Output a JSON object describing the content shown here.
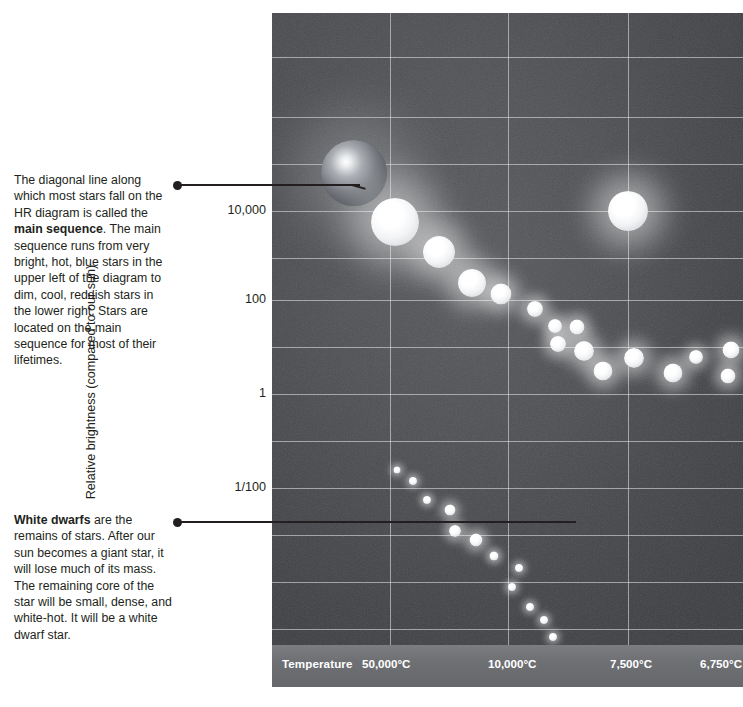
{
  "annotations": {
    "main_sequence": {
      "name": "main-sequence-note",
      "text_before": "The diagonal line along which most stars fall on the HR diagram is called the ",
      "bold": "main sequence",
      "text_after": ". The main sequence runs from very bright, hot, blue stars in the upper left of the diagram to dim, cool, reddish stars in the lower right. Stars are located on the main sequence for most of their lifetimes."
    },
    "white_dwarfs": {
      "name": "white-dwarf-note",
      "bold": "White dwarfs",
      "text_after": " are the remains of stars. After our sun becomes a giant star, it will lose much of its mass. The remaining core of the star will be small, dense, and white-hot. It will be a white dwarf star."
    }
  },
  "axes": {
    "y_title": "Relative brightness (compared to our sun)",
    "y_ticks": [
      {
        "label": "10,000",
        "y": 211
      },
      {
        "label": "100",
        "y": 300
      },
      {
        "label": "1",
        "y": 394
      },
      {
        "label": "1/100",
        "y": 488
      }
    ],
    "x_title": "Temperature",
    "x_ticks": [
      {
        "label": "50,000°C",
        "x": 90
      },
      {
        "label": "10,000°C",
        "x": 216
      },
      {
        "label": "7,500°C",
        "x": 338
      },
      {
        "label": "6,750°C",
        "x": 428
      }
    ]
  },
  "colors": {
    "plot_background": "#4b4c50",
    "gridline": "#e2e4e6",
    "axis_bar": "#6e7074",
    "axis_bar_text": "#ffffff",
    "text": "#231f20",
    "leader_line": "#231f20",
    "star_white": "#ffffff",
    "star_blue_giant": "#6f7276"
  },
  "chart_data": {
    "type": "scatter",
    "xlabel": "Temperature",
    "ylabel": "Relative brightness (compared to our sun)",
    "x_tick_labels": [
      "50,000°C",
      "10,000°C",
      "7,500°C",
      "6,750°C"
    ],
    "y_tick_labels": [
      "10,000",
      "100",
      "1",
      "1/100"
    ],
    "grid": true,
    "legend": "none",
    "x_axis_direction": "decreasing-temperature-left-to-right",
    "groups": [
      {
        "name": "main sequence",
        "points": [
          {
            "x": 82,
            "y": 160,
            "size": 66,
            "tone": "dark-blue-giant"
          },
          {
            "x": 123,
            "y": 209,
            "size": 48,
            "tone": "bright"
          },
          {
            "x": 167,
            "y": 239,
            "size": 32,
            "tone": "bright"
          },
          {
            "x": 200,
            "y": 270,
            "size": 28,
            "tone": "bright"
          },
          {
            "x": 229,
            "y": 281,
            "size": 21,
            "tone": "bright"
          },
          {
            "x": 263,
            "y": 296,
            "size": 16,
            "tone": "bright"
          },
          {
            "x": 283,
            "y": 313,
            "size": 14,
            "tone": "bright"
          },
          {
            "x": 305,
            "y": 314,
            "size": 15,
            "tone": "bright"
          },
          {
            "x": 286,
            "y": 331,
            "size": 16,
            "tone": "bright"
          },
          {
            "x": 312,
            "y": 338,
            "size": 20,
            "tone": "bright"
          },
          {
            "x": 331,
            "y": 358,
            "size": 19,
            "tone": "bright"
          },
          {
            "x": 362,
            "y": 345,
            "size": 20,
            "tone": "bright"
          },
          {
            "x": 401,
            "y": 360,
            "size": 19,
            "tone": "bright"
          },
          {
            "x": 424,
            "y": 344,
            "size": 14,
            "tone": "bright"
          },
          {
            "x": 459,
            "y": 337,
            "size": 17,
            "tone": "bright"
          },
          {
            "x": 456,
            "y": 363,
            "size": 15,
            "tone": "bright"
          }
        ]
      },
      {
        "name": "giant star (our sun after expansion)",
        "points": [
          {
            "x": 356,
            "y": 198,
            "size": 40,
            "tone": "bright"
          }
        ]
      },
      {
        "name": "white dwarfs",
        "points": [
          {
            "x": 125,
            "y": 457,
            "size": 7,
            "tone": "bright"
          },
          {
            "x": 141,
            "y": 468,
            "size": 8,
            "tone": "bright"
          },
          {
            "x": 155,
            "y": 487,
            "size": 8,
            "tone": "bright"
          },
          {
            "x": 178,
            "y": 497,
            "size": 11,
            "tone": "bright"
          },
          {
            "x": 183,
            "y": 518,
            "size": 12,
            "tone": "bright"
          },
          {
            "x": 204,
            "y": 527,
            "size": 13,
            "tone": "bright"
          },
          {
            "x": 222,
            "y": 543,
            "size": 9,
            "tone": "bright"
          },
          {
            "x": 247,
            "y": 555,
            "size": 8,
            "tone": "bright"
          },
          {
            "x": 240,
            "y": 574,
            "size": 8,
            "tone": "bright"
          },
          {
            "x": 258,
            "y": 594,
            "size": 8,
            "tone": "bright"
          },
          {
            "x": 272,
            "y": 607,
            "size": 8,
            "tone": "bright"
          },
          {
            "x": 281,
            "y": 624,
            "size": 8,
            "tone": "bright"
          }
        ]
      }
    ],
    "gridlines": {
      "vertical_x": [
        118,
        236,
        356
      ],
      "horizontal_y": [
        44,
        104,
        151,
        198,
        245,
        287,
        334,
        381,
        428,
        475,
        522,
        569,
        616
      ]
    }
  }
}
